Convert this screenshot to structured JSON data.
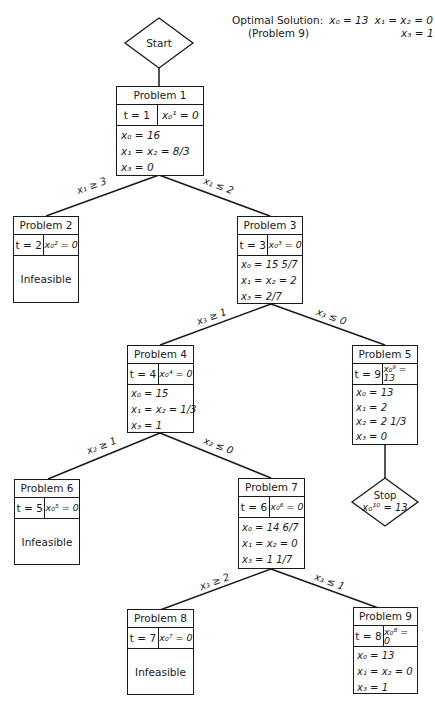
{
  "header": {
    "optimal_solution_label": "Optimal Solution:",
    "optimal_source": "(Problem 9)",
    "optimal_x0": "x₀ = 13",
    "optimal_x1x2": "x₁ = x₂ = 0",
    "optimal_x3": "x₃ = 1"
  },
  "start": {
    "label": "Start"
  },
  "stop": {
    "label": "Stop",
    "value": "x₀¹⁰ = 13"
  },
  "nodes": [
    {
      "id": 1,
      "title": "Problem 1",
      "t": "t = 1",
      "z": "x₀¹ = 0",
      "lines": [
        "x₀ = 16",
        "x₁ = x₂ = 8/3",
        "x₃ = 0"
      ]
    },
    {
      "id": 2,
      "title": "Problem 2",
      "t": "t = 2",
      "z": "x₀² = 0",
      "status": "Infeasible"
    },
    {
      "id": 3,
      "title": "Problem 3",
      "t": "t = 3",
      "z": "x₀³ = 0",
      "lines": [
        "x₀ = 15 5/7",
        "x₁ = x₂ = 2",
        "x₃ = 2/7"
      ]
    },
    {
      "id": 4,
      "title": "Problem 4",
      "t": "t = 4",
      "z": "x₀⁴ = 0",
      "lines": [
        "x₀ = 15",
        "x₁ = x₂ = 1/3",
        "x₃ = 1"
      ]
    },
    {
      "id": 5,
      "title": "Problem 5",
      "t": "t = 9",
      "z": "x₀⁹ = 13",
      "lines": [
        "x₀ = 13",
        "x₁ = 2",
        "x₂ = 2 1/3",
        "x₃ = 0"
      ]
    },
    {
      "id": 6,
      "title": "Problem 6",
      "t": "t = 5",
      "z": "x₀⁵ = 0",
      "status": "Infeasible"
    },
    {
      "id": 7,
      "title": "Problem 7",
      "t": "t = 6",
      "z": "x₀⁶ = 0",
      "lines": [
        "x₀ = 14 6/7",
        "x₁ = x₂ = 0",
        "x₃ = 1 1/7"
      ]
    },
    {
      "id": 8,
      "title": "Problem 8",
      "t": "t = 7",
      "z": "x₀⁷ = 0",
      "status": "Infeasible"
    },
    {
      "id": 9,
      "title": "Problem 9",
      "t": "t = 8",
      "z": "x₀⁸ = 0",
      "lines": [
        "x₀ = 13",
        "x₁ = x₂ = 0",
        "x₃ = 1"
      ]
    }
  ],
  "edges": [
    {
      "from": "Start",
      "to": "Problem 1",
      "label": ""
    },
    {
      "from": "Problem 1",
      "to": "Problem 2",
      "label": "x₁ ≥ 3"
    },
    {
      "from": "Problem 1",
      "to": "Problem 3",
      "label": "x₁ ≤ 2"
    },
    {
      "from": "Problem 3",
      "to": "Problem 4",
      "label": "x₃ ≥ 1"
    },
    {
      "from": "Problem 3",
      "to": "Problem 5",
      "label": "x₃ ≤ 0"
    },
    {
      "from": "Problem 4",
      "to": "Problem 6",
      "label": "x₂ ≥ 1"
    },
    {
      "from": "Problem 4",
      "to": "Problem 7",
      "label": "x₂ ≤ 0"
    },
    {
      "from": "Problem 7",
      "to": "Problem 8",
      "label": "x₃ ≥ 2"
    },
    {
      "from": "Problem 7",
      "to": "Problem 9",
      "label": "x₃ ≤ 1"
    },
    {
      "from": "Problem 5",
      "to": "Stop",
      "label": ""
    }
  ]
}
